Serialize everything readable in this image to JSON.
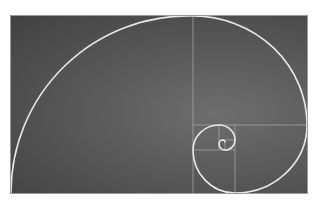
{
  "caption": {
    "text": ""
  },
  "graphic": {
    "title": "Golden spiral with Fibonacci rectangle subdivisions",
    "background_color": "#555555",
    "line_color": "#a9a9a9",
    "spiral_color": "#e6e6e6",
    "panel": {
      "x": 11,
      "y": 16,
      "width": 296,
      "height": 177
    }
  }
}
